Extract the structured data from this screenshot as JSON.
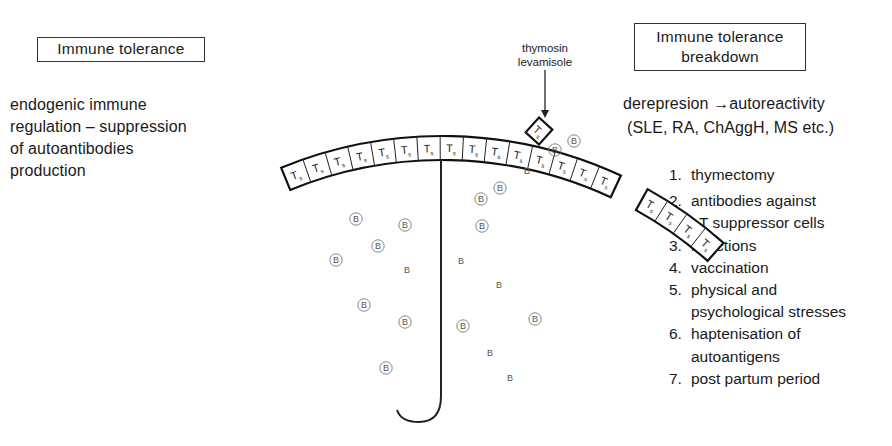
{
  "left_panel": {
    "title": "Immune  tolerance",
    "description_lines": [
      "endogenic   immune",
      "regulation – suppression",
      "of   autoantibodies",
      "production"
    ]
  },
  "right_panel": {
    "title_lines": [
      "Immune  tolerance",
      "breakdown"
    ],
    "derepression": "derepresion →autoreactivity",
    "examples": "(SLE, RA, ChAggH, MS  etc.)",
    "causes": [
      {
        "num": "1.",
        "lines": [
          "thymectomy"
        ]
      },
      {
        "num": "2.",
        "lines": [
          "antibodies   against",
          "T  suppressor  cells"
        ]
      },
      {
        "num": "3.",
        "lines": [
          "infections"
        ]
      },
      {
        "num": "4.",
        "lines": [
          "vaccination"
        ]
      },
      {
        "num": "5.",
        "lines": [
          "physical   and",
          "psychological  stresses"
        ]
      },
      {
        "num": "6.",
        "lines": [
          "haptenisation   of",
          "autoantigens"
        ]
      },
      {
        "num": "7.",
        "lines": [
          "post   partum   period"
        ]
      }
    ]
  },
  "center_diagram": {
    "drug_label_lines": [
      "thymosin",
      "levamisole"
    ],
    "t_cell_label": "T",
    "t_cell_subscript": "s",
    "b_cell_label": "B",
    "arc": {
      "cx": 442,
      "cy": 560,
      "r_outer": 424,
      "r_inner": 400
    },
    "main_arc_cells": 15,
    "main_arc_start_deg": -112.3,
    "main_arc_cell_deg": 3.15,
    "detached_cells": 4,
    "detached_start_deg": -61.0,
    "detached_cell_deg": 3.15,
    "single_cell": {
      "x": 539,
      "y": 131,
      "rotate": 42
    },
    "b_cells": [
      {
        "x": 356,
        "y": 219,
        "circled": true
      },
      {
        "x": 405,
        "y": 225,
        "circled": true
      },
      {
        "x": 378,
        "y": 246,
        "circled": true
      },
      {
        "x": 336,
        "y": 260,
        "circled": true
      },
      {
        "x": 407,
        "y": 270,
        "circled": false
      },
      {
        "x": 364,
        "y": 305,
        "circled": true
      },
      {
        "x": 405,
        "y": 322,
        "circled": true
      },
      {
        "x": 386,
        "y": 368,
        "circled": true
      },
      {
        "x": 500,
        "y": 188,
        "circled": true
      },
      {
        "x": 481,
        "y": 199,
        "circled": true
      },
      {
        "x": 482,
        "y": 226,
        "circled": true
      },
      {
        "x": 461,
        "y": 261,
        "circled": false
      },
      {
        "x": 499,
        "y": 285,
        "circled": false
      },
      {
        "x": 535,
        "y": 319,
        "circled": true
      },
      {
        "x": 463,
        "y": 326,
        "circled": true
      },
      {
        "x": 490,
        "y": 353,
        "circled": false
      },
      {
        "x": 510,
        "y": 378,
        "circled": false
      },
      {
        "x": 527,
        "y": 171,
        "circled": false
      },
      {
        "x": 555,
        "y": 150,
        "circled": true
      },
      {
        "x": 574,
        "y": 141,
        "circled": true
      }
    ],
    "stem": {
      "x": 441,
      "top": 161,
      "bottom": 396,
      "hook_end_x": 397,
      "hook_end_y": 410
    }
  }
}
